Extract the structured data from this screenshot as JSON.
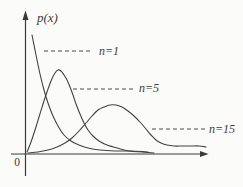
{
  "figure": {
    "background": "#fbfbfa",
    "ink_color": "#3b3b3b"
  },
  "chart_data": {
    "type": "line",
    "title": "",
    "xlabel": "",
    "ylabel": "p(x)",
    "origin_label": "0",
    "axes": "unlabeled axes with arrowheads; no numeric ticks or gridlines",
    "series": [
      {
        "name": "n=1",
        "shape": "monotonically decreasing, steep near origin, long flat right tail",
        "points": [
          [
            32,
            35
          ],
          [
            36,
            55
          ],
          [
            40,
            74
          ],
          [
            44,
            90
          ],
          [
            48,
            103
          ],
          [
            53,
            116
          ],
          [
            58,
            126
          ],
          [
            64,
            135
          ],
          [
            71,
            141
          ],
          [
            79,
            145
          ],
          [
            88,
            148
          ],
          [
            100,
            150
          ],
          [
            115,
            151
          ],
          [
            132,
            151
          ],
          [
            148,
            152
          ]
        ]
      },
      {
        "name": "n=5",
        "shape": "skewed unimodal, peak near x-left, mode highest after n=1 start",
        "points": [
          [
            27,
            152
          ],
          [
            31,
            142
          ],
          [
            35,
            130
          ],
          [
            39,
            117
          ],
          [
            43,
            104
          ],
          [
            47,
            92
          ],
          [
            51,
            81
          ],
          [
            55,
            73
          ],
          [
            58,
            70
          ],
          [
            61,
            71
          ],
          [
            64,
            75
          ],
          [
            67,
            80
          ],
          [
            70,
            87
          ],
          [
            73,
            95
          ],
          [
            76,
            104
          ],
          [
            80,
            114
          ],
          [
            84,
            123
          ],
          [
            88,
            130
          ],
          [
            93,
            136
          ],
          [
            99,
            141
          ],
          [
            107,
            145
          ],
          [
            117,
            148
          ],
          [
            129,
            151
          ],
          [
            142,
            152
          ],
          [
            154,
            153
          ]
        ]
      },
      {
        "name": "n=15",
        "shape": "broad flat unimodal hump with mode farther right, shallow long tail",
        "points": [
          [
            28,
            153
          ],
          [
            38,
            152
          ],
          [
            48,
            150
          ],
          [
            57,
            147
          ],
          [
            65,
            143
          ],
          [
            72,
            138
          ],
          [
            79,
            131
          ],
          [
            86,
            123
          ],
          [
            92,
            116
          ],
          [
            98,
            110
          ],
          [
            104,
            107
          ],
          [
            110,
            105
          ],
          [
            116,
            105
          ],
          [
            122,
            107
          ],
          [
            128,
            111
          ],
          [
            134,
            116
          ],
          [
            140,
            122
          ],
          [
            146,
            129
          ],
          [
            151,
            135
          ],
          [
            156,
            140
          ],
          [
            161,
            143
          ],
          [
            167,
            145
          ],
          [
            174,
            146
          ],
          [
            182,
            146
          ],
          [
            191,
            146
          ],
          [
            199,
            146
          ],
          [
            206,
            147
          ]
        ]
      }
    ],
    "leaders": [
      {
        "series": "n=1",
        "y": 51,
        "x1": 44,
        "x2": 93
      },
      {
        "series": "n=5",
        "y": 89,
        "x1": 73,
        "x2": 133
      },
      {
        "series": "n=15",
        "y": 129,
        "x1": 152,
        "x2": 206
      }
    ],
    "layout": {
      "y_axis": {
        "x": 25.5,
        "y_bottom": 176,
        "y_top": 19,
        "arrow_tip_y": 10.5,
        "arrow_base_y": 20,
        "arrow_half_width": 3
      },
      "x_axis": {
        "y": 154,
        "x_left": 11,
        "x_right": 200.5,
        "arrow_tip_x": 208.5,
        "arrow_base_x": 200,
        "arrow_half_width": 3
      },
      "legend": "none; labels placed at right end of dashed leaders"
    }
  }
}
